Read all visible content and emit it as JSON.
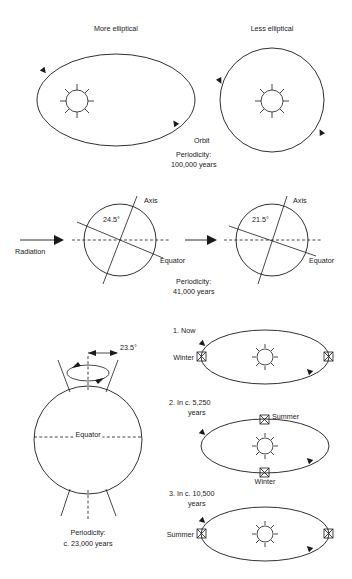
{
  "diagram": {
    "line_color": "#1a1a1a",
    "background": "#ffffff"
  },
  "eccentricity": {
    "left_label": "More elliptical",
    "right_label": "Less elliptical",
    "orbit_label": "Orbit",
    "periodicity_line1": "Periodicity:",
    "periodicity_line2": "100,000 years"
  },
  "obliquity": {
    "radiation_label": "Radiation",
    "left": {
      "angle": "24.5°",
      "axis_label": "Axis",
      "equator_label": "Equator"
    },
    "right": {
      "angle": "21.5°",
      "axis_label": "Axis",
      "equator_label": "Equator"
    },
    "periodicity_line1": "Periodicity:",
    "periodicity_line2": "41,000 years"
  },
  "precession": {
    "globe": {
      "angle": "23.5°",
      "equator_label": "Equator",
      "periodicity_line1": "Periodicity:",
      "periodicity_line2_prefix": "c.",
      "periodicity_line2": "c. 23,000 years"
    },
    "stages": [
      {
        "number": "1.",
        "title_line1": "1. Now",
        "title_line2": "",
        "left_season": "Winter",
        "top_season": "",
        "bottom_season": "",
        "right_season": ""
      },
      {
        "number": "2.",
        "title_line1": "2. In c. 5,250",
        "title_line2": "years",
        "left_season": "",
        "top_season": "Summer",
        "bottom_season": "Winter",
        "right_season": ""
      },
      {
        "number": "3.",
        "title_line1": "3. In c. 10,500",
        "title_line2": "years",
        "left_season": "Summer",
        "top_season": "",
        "bottom_season": "",
        "right_season": ""
      }
    ]
  }
}
